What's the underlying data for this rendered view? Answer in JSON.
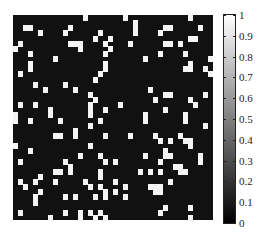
{
  "chart_data": {
    "type": "heatmap",
    "title": "",
    "xlabel": "",
    "ylabel": "",
    "rows": 40,
    "cols": 40,
    "value_range": [
      0,
      1
    ],
    "colormap": "gray",
    "colorbar": {
      "ticks": [
        0,
        0.1,
        0.2,
        0.3,
        0.4,
        0.5,
        0.6,
        0.7,
        0.8,
        0.9,
        1
      ],
      "tick_labels": [
        "0",
        "0.1",
        "0.2",
        "0.3",
        "0.4",
        "0.5",
        "0.6",
        "0.7",
        "0.8",
        "0.9",
        "1"
      ]
    },
    "ones": [
      [
        0,
        14
      ],
      [
        0,
        22
      ],
      [
        0,
        35
      ],
      [
        1,
        24
      ],
      [
        2,
        2
      ],
      [
        2,
        3
      ],
      [
        2,
        11
      ],
      [
        2,
        24
      ],
      [
        2,
        30
      ],
      [
        2,
        31
      ],
      [
        2,
        37
      ],
      [
        3,
        5
      ],
      [
        3,
        10
      ],
      [
        3,
        17
      ],
      [
        3,
        24
      ],
      [
        3,
        29
      ],
      [
        4,
        16
      ],
      [
        4,
        19
      ],
      [
        4,
        35
      ],
      [
        4,
        36
      ],
      [
        5,
        1
      ],
      [
        5,
        11
      ],
      [
        5,
        12
      ],
      [
        5,
        13
      ],
      [
        5,
        18
      ],
      [
        5,
        23
      ],
      [
        5,
        30
      ],
      [
        5,
        31
      ],
      [
        5,
        33
      ],
      [
        6,
        0
      ],
      [
        6,
        13
      ],
      [
        6,
        19
      ],
      [
        7,
        3
      ],
      [
        7,
        18
      ],
      [
        7,
        29
      ],
      [
        7,
        34
      ],
      [
        8,
        8
      ],
      [
        8,
        26
      ],
      [
        8,
        39
      ],
      [
        9,
        3
      ],
      [
        9,
        18
      ],
      [
        9,
        35
      ],
      [
        10,
        3
      ],
      [
        10,
        18
      ],
      [
        10,
        34
      ],
      [
        10,
        35
      ],
      [
        10,
        38
      ],
      [
        11,
        1
      ],
      [
        11,
        17
      ],
      [
        11,
        39
      ],
      [
        12,
        16
      ],
      [
        13,
        4
      ],
      [
        13,
        10
      ],
      [
        14,
        6
      ],
      [
        14,
        12
      ],
      [
        14,
        27
      ],
      [
        15,
        15
      ],
      [
        15,
        30
      ],
      [
        15,
        31
      ],
      [
        15,
        38
      ],
      [
        16,
        16
      ],
      [
        16,
        28
      ],
      [
        16,
        35
      ],
      [
        17,
        1
      ],
      [
        17,
        4
      ],
      [
        17,
        15
      ],
      [
        17,
        21
      ],
      [
        17,
        36
      ],
      [
        18,
        7
      ],
      [
        18,
        15
      ],
      [
        18,
        18
      ],
      [
        18,
        30
      ],
      [
        19,
        0
      ],
      [
        19,
        7
      ],
      [
        19,
        15
      ],
      [
        19,
        26
      ],
      [
        19,
        34
      ],
      [
        20,
        0
      ],
      [
        20,
        3
      ],
      [
        20,
        9
      ],
      [
        20,
        17
      ],
      [
        20,
        26
      ],
      [
        20,
        34
      ],
      [
        21,
        15
      ],
      [
        21,
        38
      ],
      [
        22,
        12
      ],
      [
        23,
        8
      ],
      [
        23,
        9
      ],
      [
        23,
        12
      ],
      [
        23,
        18
      ],
      [
        23,
        23
      ],
      [
        23,
        28
      ],
      [
        23,
        33
      ],
      [
        24,
        29
      ],
      [
        24,
        31
      ],
      [
        24,
        34
      ],
      [
        24,
        35
      ],
      [
        25,
        0
      ],
      [
        25,
        15
      ],
      [
        25,
        35
      ],
      [
        26,
        3
      ],
      [
        26,
        30
      ],
      [
        27,
        13
      ],
      [
        27,
        17
      ],
      [
        27,
        26
      ],
      [
        27,
        30
      ],
      [
        27,
        31
      ],
      [
        27,
        37
      ],
      [
        28,
        1
      ],
      [
        28,
        10
      ],
      [
        28,
        18
      ],
      [
        28,
        20
      ],
      [
        28,
        29
      ],
      [
        28,
        37
      ],
      [
        29,
        11
      ],
      [
        29,
        32
      ],
      [
        29,
        33
      ],
      [
        30,
        8
      ],
      [
        30,
        9
      ],
      [
        30,
        11
      ],
      [
        30,
        17
      ],
      [
        30,
        25
      ],
      [
        30,
        27
      ],
      [
        30,
        29
      ],
      [
        30,
        33
      ],
      [
        30,
        34
      ],
      [
        31,
        5
      ],
      [
        31,
        17
      ],
      [
        32,
        1
      ],
      [
        32,
        4
      ],
      [
        32,
        8
      ],
      [
        32,
        14
      ],
      [
        32,
        20
      ],
      [
        32,
        31
      ],
      [
        33,
        2
      ],
      [
        33,
        15
      ],
      [
        33,
        17
      ],
      [
        33,
        22
      ],
      [
        33,
        27
      ],
      [
        33,
        28
      ],
      [
        33,
        29
      ],
      [
        34,
        5
      ],
      [
        34,
        18
      ],
      [
        34,
        20
      ],
      [
        34,
        28
      ],
      [
        34,
        29
      ],
      [
        35,
        4
      ],
      [
        35,
        10
      ],
      [
        35,
        12
      ],
      [
        35,
        16
      ],
      [
        35,
        18
      ],
      [
        35,
        22
      ],
      [
        36,
        4
      ],
      [
        37,
        30
      ],
      [
        37,
        35
      ],
      [
        38,
        1
      ],
      [
        38,
        10
      ],
      [
        38,
        13
      ],
      [
        38,
        15
      ],
      [
        38,
        17
      ],
      [
        38,
        29
      ],
      [
        39,
        7
      ],
      [
        39,
        13
      ],
      [
        39,
        16
      ],
      [
        39,
        18
      ],
      [
        39,
        35
      ]
    ]
  }
}
